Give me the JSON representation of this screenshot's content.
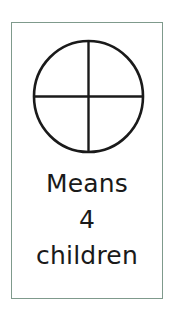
{
  "key": {
    "symbol": {
      "icon": "circle-quartered-icon",
      "represents_count": 4,
      "stroke_color": "#1a1a1a"
    },
    "caption_lines": [
      "Means",
      "4",
      "children"
    ],
    "border_color": "#7f9a8c"
  }
}
